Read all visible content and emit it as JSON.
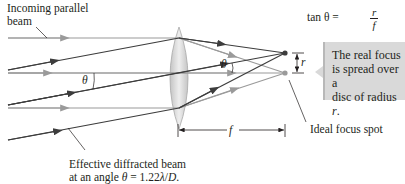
{
  "labels": {
    "incoming_line1": "Incoming parallel",
    "incoming_line2": "beam",
    "theta_left": "θ",
    "theta_right": "θ",
    "f": "f",
    "r": "r",
    "ideal_focus": "Ideal focus spot",
    "diffracted_line1": "Effective diffracted beam",
    "diffracted_line2_prefix": "at an angle ",
    "diffracted_line2_theta": "θ",
    "diffracted_line2_eq": " = 1.22",
    "diffracted_line2_lambda": "λ",
    "diffracted_line2_slash": "/",
    "diffracted_line2_D": "D",
    "diffracted_line2_end": "."
  },
  "equation": {
    "lhs": "tan θ = ",
    "numerator": "r",
    "denominator": "f"
  },
  "callout": {
    "line1": "The real focus",
    "line2": "is spread over a",
    "line3_prefix": "disc of radius ",
    "line3_r": "r",
    "line3_end": "."
  },
  "colors": {
    "parallel_ray": "#9a9a9a",
    "diffracted_ray": "#3d3d3d",
    "lens_fill": "#d0d0d0",
    "callout_bg": "#d9d9d9"
  }
}
